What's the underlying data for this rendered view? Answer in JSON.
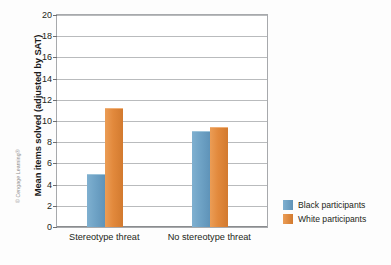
{
  "credit": "© Cengage Learning®",
  "legend": {
    "position": "right",
    "entries": [
      {
        "label": "Black participants",
        "color": "#6fa3c6",
        "swatch": "black-series"
      },
      {
        "label": "White participants",
        "color": "#e2893c",
        "swatch": "white-series"
      }
    ]
  },
  "axis": {
    "ylabel": "Mean items solved (adjusted by SAT)",
    "xlabel": "",
    "yticks": [
      0,
      2,
      4,
      6,
      8,
      10,
      12,
      14,
      16,
      18,
      20
    ]
  },
  "chart_data": {
    "type": "bar",
    "title": "",
    "subtitle": "",
    "xlabel": "",
    "ylabel": "Mean items solved (adjusted by SAT)",
    "categories": [
      "Stereotype threat",
      "No stereotype threat"
    ],
    "series": [
      {
        "name": "Black participants",
        "color": "#6fa3c6",
        "values": [
          5.0,
          9.1
        ]
      },
      {
        "name": "White participants",
        "color": "#e2893c",
        "values": [
          11.2,
          9.4
        ]
      }
    ],
    "ylim": [
      0,
      20
    ],
    "ytick_step": 2,
    "grid": true,
    "grid_axis": "y",
    "legend_position": "right",
    "annotations": [
      "© Cengage Learning®"
    ]
  }
}
